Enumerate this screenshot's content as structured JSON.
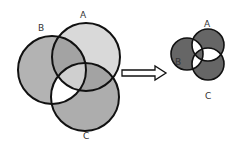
{
  "left_diagram": {
    "labels": {
      "a": "A",
      "b": "B",
      "c": "C"
    },
    "circles": {
      "a": {
        "cx": 86,
        "cy": 57,
        "r": 34
      },
      "b": {
        "cx": 52,
        "cy": 70,
        "r": 34
      },
      "c": {
        "cx": 85,
        "cy": 97,
        "r": 34
      }
    },
    "colors": {
      "a_only": "#d9d9d9",
      "b_only": "#b3b3b3",
      "c_only": "#adadad",
      "ab": "#a3a3a3",
      "ac": "#a3a3a3",
      "bc": "#ffffff",
      "abc": "#cfcfcf",
      "stroke": "#111111"
    }
  },
  "arrow": {
    "direction": "right"
  },
  "right_diagram": {
    "labels": {
      "a": "A",
      "b": "B",
      "c": "C"
    },
    "circles": {
      "a": {
        "cx": 208,
        "cy": 45,
        "r": 16
      },
      "b": {
        "cx": 187,
        "cy": 54,
        "r": 16
      },
      "c": {
        "cx": 208,
        "cy": 64,
        "r": 16
      }
    },
    "colors": {
      "single": "#666666",
      "pairwise": "#ffffff",
      "abc": "#666666",
      "stroke": "#111111"
    }
  }
}
